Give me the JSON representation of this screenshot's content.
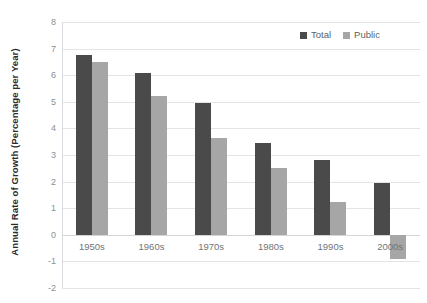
{
  "chart_data": {
    "type": "bar",
    "title": "",
    "xlabel": "",
    "ylabel": "Annual Rate of Growth (Percentage per Year)",
    "categories": [
      "1950s",
      "1960s",
      "1970s",
      "1980s",
      "1990s",
      "2000s"
    ],
    "series": [
      {
        "name": "Total",
        "color": "#4a4a4a",
        "values": [
          6.75,
          6.1,
          4.95,
          3.45,
          2.8,
          1.95
        ]
      },
      {
        "name": "Public",
        "color": "#a6a6a6",
        "values": [
          6.5,
          5.2,
          3.65,
          2.5,
          1.25,
          -0.9
        ]
      }
    ],
    "ylim": [
      -2,
      8
    ],
    "ytick_labels": [
      "8",
      "7",
      "6",
      "5",
      "4",
      "3",
      "2",
      "1",
      "0",
      "-1",
      "-2"
    ],
    "ytick_values": [
      8,
      7,
      6,
      5,
      4,
      3,
      2,
      1,
      0,
      -1,
      -2
    ],
    "grid": true,
    "legend_position": "top-right"
  }
}
